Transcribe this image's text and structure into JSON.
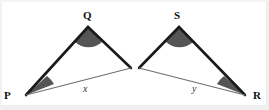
{
  "figure": {
    "type": "geometry-diagram",
    "background_color": "#ffffff",
    "stroke_color": "#1a1a1a",
    "thin_stroke_color": "#6e6e6e",
    "angle_fill_color": "#555555",
    "triangles": [
      {
        "name": "triangle-pq",
        "vertices": [
          {
            "label": "P",
            "x": 26,
            "y": 95,
            "label_x": 4,
            "label_y": 97,
            "has_angle_mark": true
          },
          {
            "label": "Q",
            "x": 88,
            "y": 27,
            "label_x": 84,
            "label_y": 17,
            "has_angle_mark": true
          },
          {
            "label": "",
            "x": 131,
            "y": 68,
            "label_x": 0,
            "label_y": 0,
            "has_angle_mark": false
          }
        ],
        "base_label": "x",
        "base_label_x": 83,
        "base_label_y": 90
      },
      {
        "name": "triangle-sr",
        "vertices": [
          {
            "label": "",
            "x": 139,
            "y": 68,
            "label_x": 0,
            "label_y": 0,
            "has_angle_mark": false
          },
          {
            "label": "S",
            "x": 179,
            "y": 27,
            "label_x": 174,
            "label_y": 17,
            "has_angle_mark": true
          },
          {
            "label": "R",
            "x": 245,
            "y": 95,
            "label_x": 253,
            "label_y": 97,
            "has_angle_mark": true
          }
        ],
        "base_label": "y",
        "base_label_x": 192,
        "base_label_y": 90
      }
    ]
  }
}
